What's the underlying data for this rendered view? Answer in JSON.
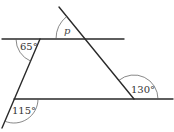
{
  "diagram": {
    "type": "geometry-parallel-lines-transversals",
    "labels": {
      "angle_top_left": "65°",
      "angle_top_p": "p",
      "angle_bottom_right": "130°",
      "angle_bottom_left": "115°"
    },
    "colors": {
      "line": "#2a2a2a",
      "arc": "#555555",
      "text": "#333333",
      "background": "#ffffff"
    }
  }
}
